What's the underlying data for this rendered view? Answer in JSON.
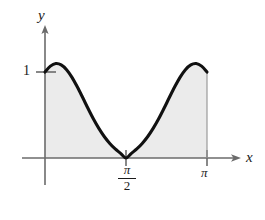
{
  "figure": {
    "background_color": "#ffffff",
    "axis_color": "#6b6b6b",
    "curve_color": "#111111",
    "shade_color": "#ebebeb"
  },
  "axes": {
    "y_label": "y",
    "x_label": "x"
  },
  "ticks": {
    "y_one": "1",
    "x_pi_over_two_numerator": "π",
    "x_pi_over_two_denominator": "2",
    "x_pi": "π"
  },
  "chart_data": {
    "type": "area",
    "title": "",
    "xlabel": "x",
    "ylabel": "y",
    "xlim": [
      0,
      3.1416
    ],
    "ylim": [
      0,
      1.25
    ],
    "grid": false,
    "legend": null,
    "xticks": [
      1.5708,
      3.1416
    ],
    "xticklabels": [
      "π/2",
      "π"
    ],
    "yticks": [
      1
    ],
    "yticklabels": [
      "1"
    ],
    "series": [
      {
        "name": "curve",
        "shaded": true,
        "x": [
          0.0,
          0.1047,
          0.2094,
          0.3142,
          0.4189,
          0.5236,
          0.6283,
          0.733,
          0.8378,
          0.9425,
          1.0472,
          1.1519,
          1.2566,
          1.3614,
          1.4661,
          1.5708,
          1.6755,
          1.7802,
          1.885,
          1.9897,
          2.0944,
          2.1991,
          2.3038,
          2.4086,
          2.5133,
          2.618,
          2.7227,
          2.8274,
          2.9322,
          3.0369,
          3.1416
        ],
        "y": [
          1.0,
          1.068,
          1.098,
          1.083,
          1.027,
          0.938,
          0.825,
          0.7,
          0.572,
          0.45,
          0.341,
          0.247,
          0.169,
          0.105,
          0.054,
          0.0,
          0.054,
          0.105,
          0.169,
          0.247,
          0.341,
          0.45,
          0.572,
          0.7,
          0.825,
          0.938,
          1.027,
          1.083,
          1.098,
          1.068,
          1.0
        ]
      }
    ],
    "annotations": [
      {
        "text": "shaded region between curve and x-axis from x=0 to x=π"
      }
    ]
  }
}
